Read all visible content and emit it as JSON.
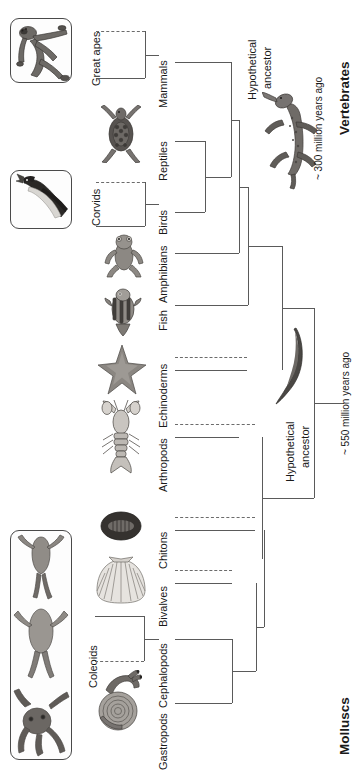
{
  "figure": {
    "type": "cladogram",
    "orientation": "rotated-90-left",
    "title_vertebrates": "Vertebrates",
    "title_molluscs": "Molluscs"
  },
  "tips": [
    {
      "label": "Mammals",
      "y": 62
    },
    {
      "label": "Reptiles",
      "y": 141
    },
    {
      "label": "Birds",
      "y": 212
    },
    {
      "label": "Amphibians",
      "y": 253
    },
    {
      "label": "Fish",
      "y": 305
    },
    {
      "label": "Echinoderms",
      "y": 370
    },
    {
      "label": "Arthropods",
      "y": 437
    },
    {
      "label": "Chitons",
      "y": 530
    },
    {
      "label": "Bivalves",
      "y": 583
    },
    {
      "label": "Cephalopods",
      "y": 639
    },
    {
      "label": "Gastropods",
      "y": 703
    }
  ],
  "clade_callouts": [
    {
      "label": "Great apes",
      "tip": "Mammals"
    },
    {
      "label": "Corvids",
      "tip": "Birds"
    },
    {
      "label": "Coleoids",
      "tip": "Cephalopods"
    }
  ],
  "ancestors": [
    {
      "label_line1": "Hypothetical",
      "label_line2": "ancestor",
      "which": "vertebrate-ancestor"
    },
    {
      "label_line1": "Hypothetical",
      "label_line2": "ancestor",
      "which": "bilaterian-ancestor"
    }
  ],
  "time_annotations": [
    {
      "text": "~ 300 million years ago",
      "for": "Vertebrates"
    },
    {
      "text": "~ 550 million years ago",
      "for": "Bilateria"
    }
  ],
  "photo_boxes": [
    {
      "name": "great-apes-photo",
      "caption_ref": "Great apes"
    },
    {
      "name": "corvids-photo",
      "caption_ref": "Corvids"
    },
    {
      "name": "coleoids-photo",
      "caption_ref": "Coleoids"
    }
  ],
  "tip_illustrations": [
    "turtle",
    "frog",
    "fish",
    "starfish",
    "lobster",
    "chiton",
    "scallop",
    "snail"
  ],
  "ancestor_illustrations": [
    "tetrapod-reptile",
    "worm"
  ],
  "colors": {
    "stroke": "#5a5a5a",
    "text": "#1a1a1a",
    "frame": "#4a4a4a",
    "background": "#ffffff"
  }
}
